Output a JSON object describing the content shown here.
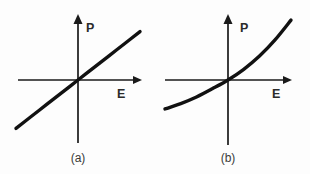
{
  "figure": {
    "background_color": "#fdfdfd",
    "ink_color": "#111111",
    "panel_count": 2
  },
  "chart_data": [
    {
      "type": "line",
      "panel_id": "a",
      "caption": "(a)",
      "title": "",
      "xlabel": "E",
      "ylabel": "P",
      "description": "Linear polarization response: P increases linearly with E through the origin",
      "grid": false,
      "legend": null,
      "axes_style": "arrow-tipped cartesian cross through origin",
      "xlim": [
        -1.1,
        1.1
      ],
      "ylim": [
        -1.1,
        1.1
      ],
      "x_tick_labels": [],
      "y_tick_labels": [],
      "origin_label": "0",
      "x": [
        -1.0,
        -0.75,
        -0.5,
        -0.25,
        0.0,
        0.25,
        0.5,
        0.75,
        1.0
      ],
      "values": [
        -0.78,
        -0.585,
        -0.39,
        -0.195,
        0.0,
        0.195,
        0.39,
        0.585,
        0.78
      ],
      "slope": 0.78,
      "intercept": 0.0
    },
    {
      "type": "line",
      "panel_id": "b",
      "caption": "(b)",
      "title": "",
      "xlabel": "E",
      "ylabel": "P",
      "description": "Nonlinear polarization response: P rises with increasing upward curvature versus E, passing through the origin",
      "grid": false,
      "legend": null,
      "axes_style": "arrow-tipped cartesian cross through origin",
      "xlim": [
        -1.1,
        1.1
      ],
      "ylim": [
        -1.1,
        1.1
      ],
      "x_tick_labels": [],
      "y_tick_labels": [],
      "origin_label": "0",
      "x": [
        -1.0,
        -0.75,
        -0.5,
        -0.25,
        0.0,
        0.25,
        0.5,
        0.75,
        1.0
      ],
      "values": [
        -0.46,
        -0.375,
        -0.27,
        -0.14,
        0.0,
        0.17,
        0.38,
        0.64,
        0.95
      ],
      "curvature": "convex-increasing"
    }
  ],
  "panels": [
    {
      "id": "a",
      "caption": "(a)",
      "y_axis_label": "P",
      "x_axis_label": "E",
      "y_axis_icon": "up-arrow-axis-icon",
      "x_axis_icon": "right-arrow-axis-icon",
      "curve_icon": "straight-line-icon"
    },
    {
      "id": "b",
      "caption": "(b)",
      "y_axis_label": "P",
      "x_axis_label": "E",
      "y_axis_icon": "up-arrow-axis-icon",
      "x_axis_icon": "right-arrow-axis-icon",
      "curve_icon": "upward-curve-icon"
    }
  ]
}
